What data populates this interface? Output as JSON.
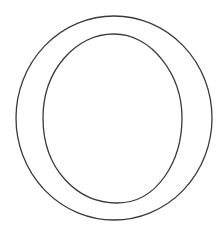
{
  "figure": {
    "description": "Outline drawing of the letter O: an outer circle with an inner egg-shaped counter",
    "stroke_color": "#3a3a3a",
    "background": "#ffffff",
    "outer_ring": {
      "cx": 114,
      "cy": 118,
      "rx": 98,
      "ry": 102
    },
    "inner_counter": {
      "top": 34,
      "bottom": 203,
      "left": 43,
      "right": 182
    }
  }
}
